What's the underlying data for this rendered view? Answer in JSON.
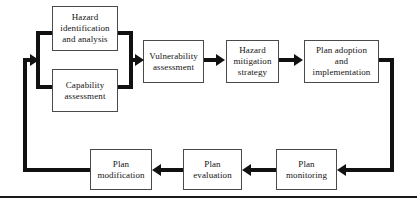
{
  "diagram": {
    "type": "flowchart",
    "colors": {
      "box_border": "#4a4a4a",
      "connector": "#111111",
      "text": "#141414",
      "background": "#ffffff",
      "rule": "#1a1a1a"
    },
    "nodes": [
      {
        "id": "hazard-identification",
        "label": "Hazard\nidentification\nand analysis",
        "line1": "Hazard",
        "line2": "identification",
        "line3": "and analysis"
      },
      {
        "id": "capability-assessment",
        "label": "Capability\nassessment",
        "line1": "Capability",
        "line2": "assessment",
        "line3": ""
      },
      {
        "id": "vulnerability-assessment",
        "label": "Vulnerability\nassessment",
        "line1": "Vulnerability",
        "line2": "assessment",
        "line3": ""
      },
      {
        "id": "hazard-mitigation-strategy",
        "label": "Hazard\nmitigation\nstrategy",
        "line1": "Hazard",
        "line2": "mitigation",
        "line3": "strategy"
      },
      {
        "id": "plan-adoption",
        "label": "Plan adoption\nand\nimplementation",
        "line1": "Plan adoption",
        "line2": "and",
        "line3": "implementation"
      },
      {
        "id": "plan-monitoring",
        "label": "Plan\nmonitoring",
        "line1": "Plan",
        "line2": "monitoring",
        "line3": ""
      },
      {
        "id": "plan-evaluation",
        "label": "Plan\nevaluation",
        "line1": "Plan",
        "line2": "evaluation",
        "line3": ""
      },
      {
        "id": "plan-modification",
        "label": "Plan\nmodification",
        "line1": "Plan",
        "line2": "modification",
        "line3": ""
      }
    ],
    "edges": [
      {
        "from": "hazard-identification",
        "to": "vulnerability-assessment",
        "style": "merge-bracket"
      },
      {
        "from": "capability-assessment",
        "to": "vulnerability-assessment",
        "style": "merge-bracket"
      },
      {
        "from": "vulnerability-assessment",
        "to": "hazard-mitigation-strategy",
        "style": "straight-arrow"
      },
      {
        "from": "hazard-mitigation-strategy",
        "to": "plan-adoption",
        "style": "straight-arrow"
      },
      {
        "from": "plan-adoption",
        "to": "plan-monitoring",
        "style": "right-down-left"
      },
      {
        "from": "plan-monitoring",
        "to": "plan-evaluation",
        "style": "straight-arrow-left"
      },
      {
        "from": "plan-evaluation",
        "to": "plan-modification",
        "style": "straight-arrow-left"
      },
      {
        "from": "plan-modification",
        "to": "hazard-identification",
        "style": "left-up-feedback"
      }
    ]
  }
}
